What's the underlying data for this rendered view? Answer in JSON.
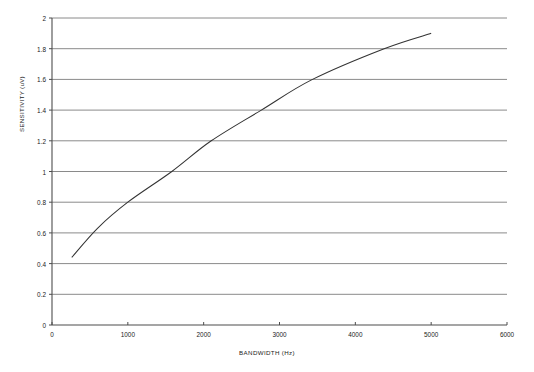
{
  "chart_data": {
    "type": "line",
    "title": "",
    "xlabel": "BANDWIDTH (Hz)",
    "ylabel": "SENSITIVITY (uV)",
    "xlim": [
      0,
      6000
    ],
    "ylim": [
      0,
      2
    ],
    "xticks": [
      0,
      1000,
      2000,
      3000,
      4000,
      5000,
      6000
    ],
    "xtick_labels": [
      "0",
      "1000",
      "2000",
      "3000",
      "4000",
      "5000",
      "6000"
    ],
    "yticks": [
      0,
      0.2,
      0.4,
      0.6,
      0.8,
      1,
      1.2,
      1.4,
      1.6,
      1.8,
      2
    ],
    "ytick_labels": [
      "0",
      "0.2",
      "0.4",
      "0.6",
      "0.8",
      "1",
      "1.2",
      "1.4",
      "1.6",
      "1.8",
      "2"
    ],
    "grid": "horizontal",
    "legend": "none",
    "series": [
      {
        "name": "sensitivity",
        "color": "#333333",
        "x": [
          260,
          600,
          1000,
          1580,
          2100,
          2760,
          3435,
          4380,
          5000
        ],
        "y": [
          0.44,
          0.63,
          0.8,
          1.0,
          1.2,
          1.4,
          1.6,
          1.8,
          1.9
        ]
      }
    ],
    "annotations": []
  },
  "style": {
    "grid_color": "#8a8a8a",
    "axis_color": "#4d4d4d",
    "line_color": "#333333",
    "background": "#ffffff"
  }
}
